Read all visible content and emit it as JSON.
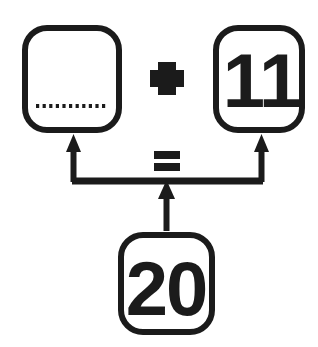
{
  "diagram": {
    "type": "part-part-whole-addition-diagram",
    "stroke_color": "#1b1b1b",
    "fill_color": "#ffffff",
    "background_color": "#ffffff",
    "equation": "? + 11 = 20",
    "boxes": [
      {
        "id": "addend-unknown",
        "role": "missing-addend",
        "value": "",
        "placeholder_style": "dotted-line",
        "x": 22,
        "y": 25,
        "width": 100,
        "height": 108
      },
      {
        "id": "addend-known",
        "role": "known-addend",
        "value": "11",
        "placeholder_style": "none",
        "x": 213,
        "y": 25,
        "width": 92,
        "height": 108
      },
      {
        "id": "sum-total",
        "role": "total",
        "value": "20",
        "placeholder_style": "none",
        "x": 118,
        "y": 232,
        "width": 97,
        "height": 103
      }
    ],
    "operators": [
      {
        "id": "plus-operator",
        "symbol": "+",
        "x": 167,
        "y": 78
      },
      {
        "id": "equals-operator",
        "symbol": "=",
        "x": 167,
        "y": 160
      }
    ],
    "connectors": [
      {
        "id": "left-branch-arrow",
        "from": "connector-bar",
        "to": "addend-unknown",
        "direction": "up"
      },
      {
        "id": "right-branch-arrow",
        "from": "connector-bar",
        "to": "addend-known",
        "direction": "up"
      },
      {
        "id": "total-stem-arrow",
        "from": "sum-total",
        "to": "connector-bar",
        "direction": "up"
      }
    ]
  }
}
